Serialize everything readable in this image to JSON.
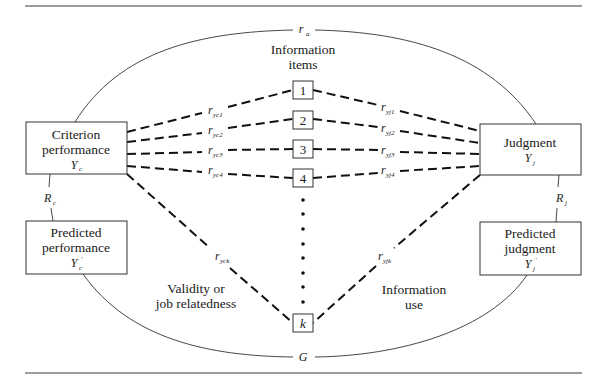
{
  "diagram": {
    "title_center": {
      "line1": "Information",
      "line2": "items"
    },
    "nodes": {
      "criterion": {
        "line1": "Criterion",
        "line2": "performance",
        "symbol": "Y",
        "subscript": "c"
      },
      "predicted_performance": {
        "line1": "Predicted",
        "line2": "performance",
        "symbol": "Y",
        "subscript": "c",
        "prime": "′"
      },
      "judgment": {
        "line1": "Judgment",
        "symbol": "Y",
        "subscript": "j"
      },
      "predicted_judgment": {
        "line1": "Predicted",
        "line2": "judgment",
        "symbol": "Y",
        "subscript": "j",
        "prime": "′"
      }
    },
    "items": [
      {
        "label": "1"
      },
      {
        "label": "2"
      },
      {
        "label": "3"
      },
      {
        "label": "4"
      },
      {
        "label": "k"
      }
    ],
    "validity_edges": [
      {
        "symbol": "r",
        "subscript": "yc1"
      },
      {
        "symbol": "r",
        "subscript": "yc2"
      },
      {
        "symbol": "r",
        "subscript": "yc3"
      },
      {
        "symbol": "r",
        "subscript": "yc4"
      },
      {
        "symbol": "r",
        "subscript": "yck"
      }
    ],
    "use_edges": [
      {
        "symbol": "r",
        "subscript": "yj1"
      },
      {
        "symbol": "r",
        "subscript": "yj2"
      },
      {
        "symbol": "r",
        "subscript": "yj3"
      },
      {
        "symbol": "r",
        "subscript": "yj4"
      },
      {
        "symbol": "r",
        "subscript": "yjk"
      }
    ],
    "arcs": {
      "top": {
        "symbol": "r",
        "subscript": "a"
      },
      "bottom": {
        "symbol": "G"
      },
      "left": {
        "symbol": "R",
        "subscript": "c"
      },
      "right": {
        "symbol": "R",
        "subscript": "j"
      }
    },
    "region_labels": {
      "validity": {
        "line1": "Validity or",
        "line2": "job relatedness"
      },
      "use": {
        "line1": "Information",
        "line2": "use"
      }
    },
    "ellipsis_dot_count": 8
  }
}
